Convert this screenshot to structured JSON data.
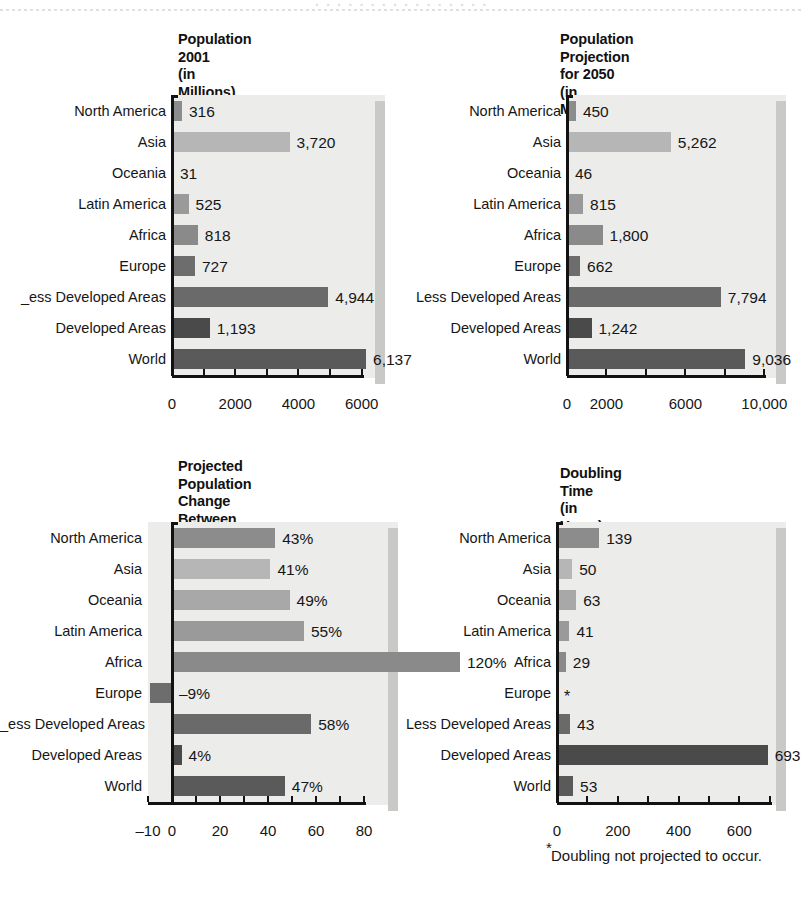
{
  "scan": {
    "top_fragment": "· · · · · · · · · · · · · · · ·"
  },
  "categories": [
    "North America",
    "Asia",
    "Oceania",
    "Latin America",
    "Africa",
    "Europe",
    "Less Developed Areas",
    "Developed Areas",
    "World"
  ],
  "category_labels_left_clipped": [
    "North America",
    "Asia",
    "Oceania",
    "Latin America",
    "Africa",
    "Europe",
    "_ess Developed Areas",
    "Developed Areas",
    "World"
  ],
  "palette": {
    "north_america": "#8c8c8c",
    "asia": "#b6b6b6",
    "oceania": "#a8a8a8",
    "latin_america": "#9a9a9a",
    "africa": "#8a8a8a",
    "europe": "#6d6d6d",
    "less_developed": "#6a6a6a",
    "developed": "#4a4a4a",
    "world": "#5a5a5a",
    "plot_background": "#ececeb",
    "plot_shadow": "#c9c9c7",
    "axis": "#121212"
  },
  "chart_data": [
    {
      "id": "population-2001",
      "type": "bar",
      "orientation": "horizontal",
      "title": "Population\n2001\n(in Millions)",
      "title_lines": [
        "Population",
        "2001",
        "(in Millions)"
      ],
      "xlabel": "",
      "ylabel": "",
      "xlim": [
        0,
        6800
      ],
      "grid": false,
      "categories": [
        "North America",
        "Asia",
        "Oceania",
        "Latin America",
        "Africa",
        "Europe",
        "Less Developed Areas",
        "Developed Areas",
        "World"
      ],
      "values": [
        316,
        3720,
        31,
        525,
        818,
        727,
        4944,
        1193,
        6137
      ],
      "value_labels": [
        "316",
        "3,720",
        "31",
        "525",
        "818",
        "727",
        "4,944",
        "1,193",
        "6,137"
      ],
      "ticks": [
        0,
        1000,
        2000,
        3000,
        4000,
        5000,
        6000
      ],
      "tick_labels": [
        {
          "value": 0,
          "text": "0"
        },
        {
          "value": 2000,
          "text": "2000"
        },
        {
          "value": 4000,
          "text": "4000"
        },
        {
          "value": 6000,
          "text": "6000"
        }
      ]
    },
    {
      "id": "population-projection-2050",
      "type": "bar",
      "orientation": "horizontal",
      "title": "Population Projection\nfor 2050\n(in Millions)",
      "title_lines": [
        "Population Projection",
        "for 2050",
        "(in Millions)"
      ],
      "xlabel": "",
      "ylabel": "",
      "xlim": [
        0,
        11200
      ],
      "grid": false,
      "categories": [
        "North America",
        "Asia",
        "Oceania",
        "Latin America",
        "Africa",
        "Europe",
        "Less Developed Areas",
        "Developed Areas",
        "World"
      ],
      "values": [
        450,
        5262,
        46,
        815,
        1800,
        662,
        7794,
        1242,
        9036
      ],
      "value_labels": [
        "450",
        "5,262",
        "46",
        "815",
        "1,800",
        "662",
        "7,794",
        "1,242",
        "9,036"
      ],
      "ticks": [
        0,
        2000,
        4000,
        6000,
        8000,
        10000
      ],
      "tick_labels": [
        {
          "value": 0,
          "text": "0"
        },
        {
          "value": 2000,
          "text": "2000"
        },
        {
          "value": 6000,
          "text": "6000"
        },
        {
          "value": 10000,
          "text": "10,000"
        }
      ]
    },
    {
      "id": "projected-population-change",
      "type": "bar",
      "orientation": "horizontal",
      "title": "Projected Population\nChange Between\n2001 and 2050",
      "title_lines": [
        "Projected Population",
        "Change Between",
        "2001 and 2050"
      ],
      "xlabel": "",
      "ylabel": "",
      "xlim": [
        -10,
        95
      ],
      "grid": false,
      "unit": "%",
      "categories": [
        "North America",
        "Asia",
        "Oceania",
        "Latin America",
        "Africa",
        "Europe",
        "Less Developed Areas",
        "Developed Areas",
        "World"
      ],
      "values": [
        43,
        41,
        49,
        55,
        120,
        -9,
        58,
        4,
        47
      ],
      "value_labels": [
        "43%",
        "41%",
        "49%",
        "55%",
        "120%",
        "–9%",
        "58%",
        "4%",
        "47%"
      ],
      "ticks": [
        -10,
        0,
        10,
        20,
        30,
        40,
        50,
        60,
        70,
        80
      ],
      "tick_labels": [
        {
          "value": -10,
          "text": "–10"
        },
        {
          "value": 0,
          "text": "0"
        },
        {
          "value": 20,
          "text": "20"
        },
        {
          "value": 40,
          "text": "40"
        },
        {
          "value": 60,
          "text": "60"
        },
        {
          "value": 80,
          "text": "80"
        }
      ]
    },
    {
      "id": "doubling-time",
      "type": "bar",
      "orientation": "horizontal",
      "title": "Doubling Time\n(in Years)",
      "title_lines": [
        "Doubling Time",
        "(in Years)"
      ],
      "xlabel": "",
      "ylabel": "",
      "xlim": [
        0,
        760
      ],
      "grid": false,
      "categories": [
        "North America",
        "Asia",
        "Oceania",
        "Latin America",
        "Africa",
        "Europe",
        "Less Developed Areas",
        "Developed Areas",
        "World"
      ],
      "values": [
        139,
        50,
        63,
        41,
        29,
        null,
        43,
        693,
        53
      ],
      "value_labels": [
        "139",
        "50",
        "63",
        "41",
        "29",
        "*",
        "43",
        "693",
        "53"
      ],
      "ticks": [
        0,
        100,
        200,
        300,
        400,
        500,
        600,
        700
      ],
      "tick_labels": [
        {
          "value": 0,
          "text": "0"
        },
        {
          "value": 200,
          "text": "200"
        },
        {
          "value": 400,
          "text": "400"
        },
        {
          "value": 600,
          "text": "600"
        }
      ],
      "footnote_marker": "*",
      "footnote": "Doubling not projected to occur."
    }
  ]
}
